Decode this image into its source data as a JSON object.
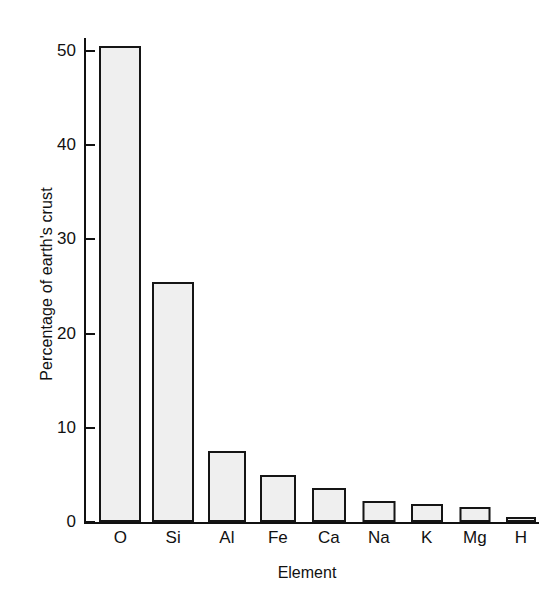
{
  "chart_data": {
    "type": "bar",
    "title": "",
    "xlabel": "Element",
    "ylabel": "Percentage of earth's crust",
    "categories": [
      "O",
      "Si",
      "Al",
      "Fe",
      "Ca",
      "Na",
      "K",
      "Mg",
      "H"
    ],
    "values": [
      50.5,
      25.5,
      7.5,
      5.0,
      3.6,
      2.2,
      1.9,
      1.6,
      0.5
    ],
    "ylim": [
      0,
      52
    ],
    "yticks": [
      0,
      10,
      20,
      30,
      40,
      50
    ],
    "ytick_labels": [
      "0",
      "10",
      "20",
      "30",
      "40",
      "50"
    ],
    "xlim": [
      0,
      9
    ],
    "grid": false,
    "legend": null,
    "bar_fill_color": "#efefef",
    "bar_edge_color": "#151515",
    "background_color": "#ffffff",
    "bars": [
      {
        "label": "O",
        "value": 50.5,
        "center_pct": 8.0,
        "width_px": 42
      },
      {
        "label": "Si",
        "value": 25.5,
        "center_pct": 19.6,
        "width_px": 42
      },
      {
        "label": "Al",
        "value": 7.5,
        "center_pct": 31.4,
        "width_px": 38
      },
      {
        "label": "Fe",
        "value": 5.0,
        "center_pct": 42.6,
        "width_px": 36
      },
      {
        "label": "Ca",
        "value": 3.6,
        "center_pct": 53.8,
        "width_px": 34
      },
      {
        "label": "Na",
        "value": 2.2,
        "center_pct": 64.8,
        "width_px": 33
      },
      {
        "label": "K",
        "value": 1.9,
        "center_pct": 75.3,
        "width_px": 32
      },
      {
        "label": "Mg",
        "value": 1.6,
        "center_pct": 85.9,
        "width_px": 31
      },
      {
        "label": "H",
        "value": 0.5,
        "center_pct": 96.0,
        "width_px": 30
      }
    ]
  }
}
